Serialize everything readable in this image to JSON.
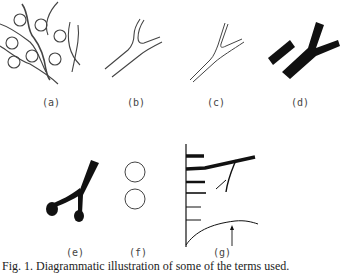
{
  "figure": {
    "panels": [
      {
        "id": "a",
        "label": "(a)",
        "description": "tangled filaments with circles"
      },
      {
        "id": "b",
        "label": "(b)",
        "description": "branching double-line outline"
      },
      {
        "id": "c",
        "label": "(c)",
        "description": "narrow branching double-line"
      },
      {
        "id": "d",
        "label": "(d)",
        "description": "solid branched shape with separate block"
      },
      {
        "id": "e",
        "label": "(e)",
        "description": "solid branched shape with bulbous tips"
      },
      {
        "id": "f",
        "label": "(f)",
        "description": "two circles"
      },
      {
        "id": "g",
        "label": "(g)",
        "description": "axis with horizontal bars, branch and curve with arrow"
      }
    ],
    "caption": "Fig. 1.   Diagrammatic illustration of some of the terms used."
  }
}
